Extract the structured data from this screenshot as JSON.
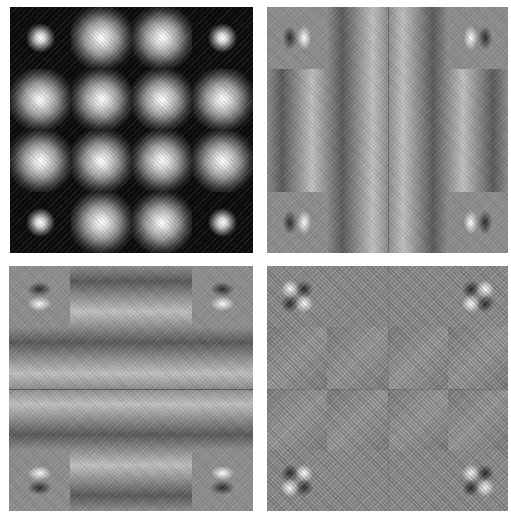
{
  "figure": {
    "layout": "2x2 grid of grayscale image panels",
    "panels": [
      {
        "id": "top-left",
        "description": "4x4 grid of bright Gaussian blobs on black; corner blobs smaller",
        "grid": [
          4,
          4
        ],
        "corner_blob": "small"
      },
      {
        "id": "top-right",
        "description": "Horizontal derivative response; corner cells show dark/bright lobe pairs",
        "grid": [
          4,
          4
        ],
        "center_line": "vertical"
      },
      {
        "id": "bottom-left",
        "description": "Vertical derivative response; corner cells show dark/bright lobe pairs stacked vertically",
        "grid": [
          4,
          4
        ],
        "center_line": "horizontal"
      },
      {
        "id": "bottom-right",
        "description": "Mixed (cross) derivative response; corner cells show quadrant checker lobes",
        "grid": [
          4,
          4
        ],
        "center_line": "both"
      }
    ]
  },
  "colors": {
    "background": "#ffffff",
    "panel_black": "#0c0c0c",
    "panel_gray": "#8d8d8d",
    "highlight": "#ffffff",
    "shadow": "#2a2a2a"
  }
}
